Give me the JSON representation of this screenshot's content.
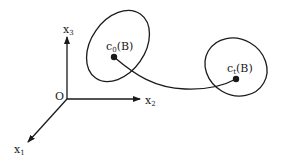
{
  "diagram": {
    "axes": {
      "origin_label": "O",
      "x1": {
        "base": "x",
        "sub": "1"
      },
      "x2": {
        "base": "x",
        "sub": "2"
      },
      "x3": {
        "base": "x",
        "sub": "3"
      }
    },
    "initial_config": {
      "base": "c",
      "sub": "0",
      "suffix": "(B)"
    },
    "current_config": {
      "base": "c",
      "sub": "t",
      "suffix": "(B)"
    },
    "colors": {
      "stroke": "#1a1a1a",
      "background": "#ffffff"
    }
  }
}
